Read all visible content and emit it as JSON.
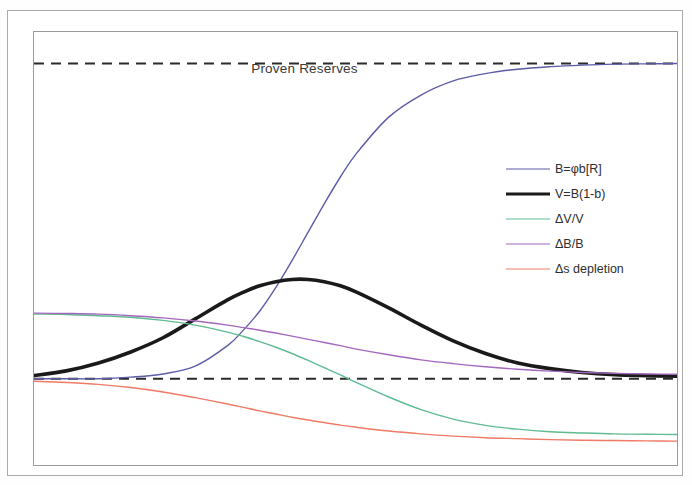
{
  "figure": {
    "title": "Proven Reserves",
    "background": "#ffffff",
    "frame_color": "#9a9a98"
  },
  "legend": {
    "position": "center-right",
    "entries": [
      {
        "label": "B=φb[R]",
        "color": "#5c5ca8",
        "width": 1.4,
        "style": "solid"
      },
      {
        "label": "V=B(1-b)",
        "color": "#1a1a1a",
        "width": 3.6,
        "style": "solid"
      },
      {
        "label": "ΔV/V",
        "color": "#5fbb92",
        "width": 1.4,
        "style": "solid"
      },
      {
        "label": "ΔB/B",
        "color": "#a368bd",
        "width": 1.4,
        "style": "solid"
      },
      {
        "label": "Δs depletion",
        "color": "#ef7a66",
        "width": 1.4,
        "style": "solid"
      }
    ]
  },
  "annotations": [
    {
      "name": "proven-reserves-line",
      "label": "Proven Reserves",
      "style": "dashed",
      "color": "#2b2b2b",
      "y_value": 1.0
    },
    {
      "name": "baseline-zero-line",
      "label": "",
      "style": "dashed",
      "color": "#2b2b2b",
      "y_value": 0.0
    }
  ],
  "chart_data": {
    "type": "line",
    "title": "Proven Reserves",
    "xlabel": "",
    "ylabel": "",
    "xlim": [
      0,
      100
    ],
    "ylim": [
      -0.28,
      1.1
    ],
    "grid": false,
    "legend_position": "center-right",
    "reference_lines": [
      {
        "name": "Proven Reserves",
        "y": 1.0,
        "style": "dashed",
        "color": "#2b2b2b"
      },
      {
        "name": "baseline",
        "y": 0.0,
        "style": "dashed",
        "color": "#2b2b2b"
      }
    ],
    "x": [
      0,
      5,
      10,
      15,
      20,
      25,
      30,
      32.5,
      35,
      37.5,
      40,
      42.5,
      45,
      47.5,
      50,
      55,
      60,
      65,
      70,
      75,
      80,
      85,
      90,
      95,
      100
    ],
    "series": [
      {
        "name": "B=φb[R]",
        "color": "#5c5ca8",
        "width": 1.4,
        "values": [
          0.0,
          0.0,
          0.0,
          0.005,
          0.015,
          0.04,
          0.105,
          0.155,
          0.215,
          0.29,
          0.375,
          0.465,
          0.555,
          0.64,
          0.715,
          0.83,
          0.9,
          0.945,
          0.968,
          0.982,
          0.99,
          0.995,
          0.998,
          0.999,
          1.0
        ]
      },
      {
        "name": "V=B(1-b)",
        "color": "#1a1a1a",
        "width": 3.6,
        "values": [
          0.01,
          0.025,
          0.05,
          0.085,
          0.13,
          0.19,
          0.25,
          0.275,
          0.295,
          0.308,
          0.315,
          0.315,
          0.308,
          0.295,
          0.275,
          0.225,
          0.17,
          0.12,
          0.08,
          0.05,
          0.032,
          0.02,
          0.013,
          0.01,
          0.008
        ]
      },
      {
        "name": "ΔV/V",
        "color": "#5fbb92",
        "width": 1.4,
        "values": [
          0.205,
          0.204,
          0.2,
          0.195,
          0.185,
          0.17,
          0.148,
          0.134,
          0.118,
          0.1,
          0.08,
          0.058,
          0.035,
          0.012,
          -0.012,
          -0.058,
          -0.098,
          -0.128,
          -0.148,
          -0.16,
          -0.168,
          -0.172,
          -0.175,
          -0.176,
          -0.177
        ]
      },
      {
        "name": "ΔB/B",
        "color": "#a368bd",
        "width": 1.4,
        "values": [
          0.208,
          0.207,
          0.205,
          0.2,
          0.193,
          0.183,
          0.17,
          0.162,
          0.154,
          0.145,
          0.135,
          0.125,
          0.115,
          0.105,
          0.094,
          0.076,
          0.06,
          0.048,
          0.038,
          0.03,
          0.024,
          0.02,
          0.017,
          0.015,
          0.014
        ]
      },
      {
        "name": "Δs depletion",
        "color": "#ef7a66",
        "width": 1.4,
        "values": [
          -0.008,
          -0.012,
          -0.018,
          -0.028,
          -0.042,
          -0.06,
          -0.08,
          -0.091,
          -0.102,
          -0.112,
          -0.122,
          -0.131,
          -0.139,
          -0.147,
          -0.154,
          -0.166,
          -0.175,
          -0.182,
          -0.187,
          -0.19,
          -0.193,
          -0.195,
          -0.196,
          -0.197,
          -0.198
        ]
      }
    ]
  }
}
